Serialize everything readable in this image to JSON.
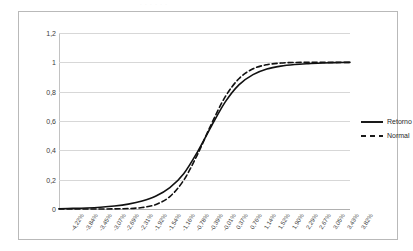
{
  "scan_artifact_text": "·   ·  · ·   ·    ·",
  "legend": {
    "position": "right",
    "entries": [
      {
        "label": "Retorno",
        "style": "solid",
        "swatch": "solid-line-swatch"
      },
      {
        "label": "Normal",
        "style": "dashed",
        "swatch": "dashed-line-swatch"
      }
    ]
  },
  "axes": {
    "y_ticks": [
      "0",
      "0,2",
      "0,4",
      "0,6",
      "0,8",
      "1",
      "1,2"
    ],
    "x_ticks": [
      "-4,22%",
      "-3,84%",
      "-3,45%",
      "-3,07%",
      "-2,69%",
      "-2,31%",
      "-1,92%",
      "-1,54%",
      "-1,16%",
      "-0,78%",
      "-0,39%",
      "-0,01%",
      "0,37%",
      "0,76%",
      "1,14%",
      "1,52%",
      "1,90%",
      "2,29%",
      "2,67%",
      "3,05%",
      "3,43%",
      "3,82%"
    ]
  },
  "chart_data": {
    "type": "line",
    "title": "",
    "subtitle": "",
    "xlabel": "",
    "ylabel": "",
    "grid": true,
    "legend_position": "right",
    "ylim": [
      0,
      1.2
    ],
    "ytick_values": [
      0,
      0.2,
      0.4,
      0.6,
      0.8,
      1.0,
      1.2
    ],
    "ytick_labels": [
      "0",
      "0,2",
      "0,4",
      "0,6",
      "0,8",
      "1",
      "1,2"
    ],
    "x": [
      -4.22,
      -3.84,
      -3.45,
      -3.07,
      -2.69,
      -2.31,
      -1.92,
      -1.54,
      -1.16,
      -0.78,
      -0.39,
      -0.01,
      0.37,
      0.76,
      1.14,
      1.52,
      1.9,
      2.29,
      2.67,
      3.05,
      3.43,
      3.82
    ],
    "xtick_labels": [
      "-4,22%",
      "-3,84%",
      "-3,45%",
      "-3,07%",
      "-2,69%",
      "-2,31%",
      "-1,92%",
      "-1,54%",
      "-1,16%",
      "-0,78%",
      "-0,39%",
      "-0,01%",
      "0,37%",
      "0,76%",
      "1,14%",
      "1,52%",
      "1,90%",
      "2,29%",
      "2,67%",
      "3,05%",
      "3,43%",
      "3,82%"
    ],
    "xunit": "%",
    "series": [
      {
        "name": "Retorno",
        "style": "solid",
        "color": "#111111",
        "values": [
          0.002,
          0.004,
          0.007,
          0.012,
          0.02,
          0.033,
          0.054,
          0.088,
          0.145,
          0.24,
          0.39,
          0.565,
          0.73,
          0.848,
          0.916,
          0.954,
          0.974,
          0.985,
          0.991,
          0.995,
          0.998,
          1.0
        ]
      },
      {
        "name": "Normal",
        "style": "dashed",
        "color": "#111111",
        "values": [
          0.0,
          0.0,
          0.0,
          0.0,
          0.001,
          0.003,
          0.01,
          0.031,
          0.085,
          0.196,
          0.373,
          0.58,
          0.766,
          0.89,
          0.956,
          0.984,
          0.995,
          0.999,
          1.0,
          1.0,
          1.0,
          1.0
        ]
      }
    ]
  }
}
